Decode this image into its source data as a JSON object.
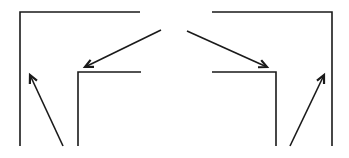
{
  "diagram": {
    "stroke_color": "#1a1a1a",
    "background": "#ffffff",
    "stroke_width": 1.6,
    "shapes": [
      {
        "name": "left-outer-corner",
        "points": [
          [
            20,
            146
          ],
          [
            20,
            12
          ],
          [
            140,
            12
          ]
        ]
      },
      {
        "name": "left-inner-corner",
        "points": [
          [
            78,
            146
          ],
          [
            78,
            72
          ],
          [
            141,
            72
          ]
        ]
      },
      {
        "name": "right-outer-corner",
        "points": [
          [
            212,
            12
          ],
          [
            332,
            12
          ],
          [
            332,
            146
          ]
        ]
      },
      {
        "name": "right-inner-corner",
        "points": [
          [
            212,
            72
          ],
          [
            276,
            72
          ],
          [
            276,
            146
          ]
        ]
      }
    ],
    "arrows": [
      {
        "name": "left-diagonal-arrow",
        "from": [
          161,
          30
        ],
        "to": [
          85,
          67
        ]
      },
      {
        "name": "left-bottom-arrow",
        "from": [
          63,
          146
        ],
        "to": [
          30,
          75
        ]
      },
      {
        "name": "right-diagonal-arrow",
        "from": [
          187,
          31
        ],
        "to": [
          267,
          67
        ]
      },
      {
        "name": "right-bottom-arrow",
        "from": [
          290,
          146
        ],
        "to": [
          324,
          75
        ]
      }
    ]
  }
}
